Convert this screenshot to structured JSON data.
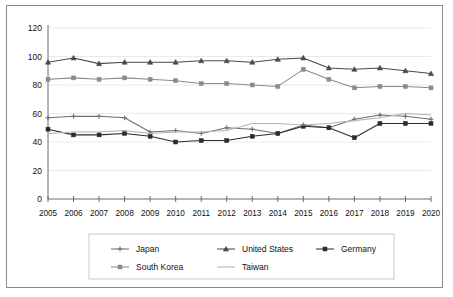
{
  "chart_data": {
    "type": "line",
    "title": "",
    "subtitle": "",
    "xlabel": "",
    "ylabel": "",
    "ylim": [
      0,
      120
    ],
    "yticks": [
      0,
      20,
      40,
      60,
      80,
      100,
      120
    ],
    "grid": true,
    "legend_position": "bottom",
    "categories": [
      "2005",
      "2006",
      "2007",
      "2008",
      "2009",
      "2010",
      "2011",
      "2012",
      "2013",
      "2014",
      "2015",
      "2016",
      "2017",
      "2018",
      "2019",
      "2020"
    ],
    "series": [
      {
        "name": "Japan",
        "marker": "plus",
        "color": "#6f6f6f",
        "values": [
          57,
          58,
          58,
          57,
          47,
          48,
          46,
          50,
          49,
          46,
          52,
          50,
          56,
          59,
          58,
          56
        ]
      },
      {
        "name": "United States",
        "marker": "triangle",
        "color": "#4a4a4a",
        "values": [
          96,
          99,
          95,
          96,
          96,
          96,
          97,
          97,
          96,
          98,
          99,
          92,
          91,
          92,
          90,
          88
        ]
      },
      {
        "name": "Germany",
        "marker": "square",
        "color": "#2b2b2b",
        "values": [
          49,
          45,
          45,
          46,
          44,
          40,
          41,
          41,
          44,
          46,
          51,
          50,
          43,
          53,
          53,
          53
        ]
      },
      {
        "name": "South Korea",
        "marker": "square",
        "color": "#8a8a8a",
        "values": [
          84,
          85,
          84,
          85,
          84,
          83,
          81,
          81,
          80,
          79,
          91,
          84,
          78,
          79,
          79,
          78
        ]
      },
      {
        "name": "Taiwan",
        "marker": "none",
        "color": "#b4b4b4",
        "values": [
          46,
          47,
          47,
          48,
          46,
          47,
          47,
          48,
          53,
          53,
          52,
          53,
          55,
          57,
          60,
          59
        ]
      }
    ]
  },
  "axes": {
    "y_tick_labels": [
      "0",
      "20",
      "40",
      "60",
      "80",
      "100",
      "120"
    ],
    "x_tick_labels": [
      "2005",
      "2006",
      "2007",
      "2008",
      "2009",
      "2010",
      "2011",
      "2012",
      "2013",
      "2014",
      "2015",
      "2016",
      "2017",
      "2018",
      "2019",
      "2020"
    ]
  },
  "legend": {
    "entries": [
      {
        "label": "Japan"
      },
      {
        "label": "United States"
      },
      {
        "label": "Germany"
      },
      {
        "label": "South Korea"
      },
      {
        "label": "Taiwan"
      }
    ]
  },
  "colors": {
    "background": "#ffffff",
    "frame_border": "#8b8b8b",
    "grid": "#e4e4e4",
    "axis": "#6d6d6d",
    "legend_border": "#c9c9c9",
    "text": "#111111"
  }
}
